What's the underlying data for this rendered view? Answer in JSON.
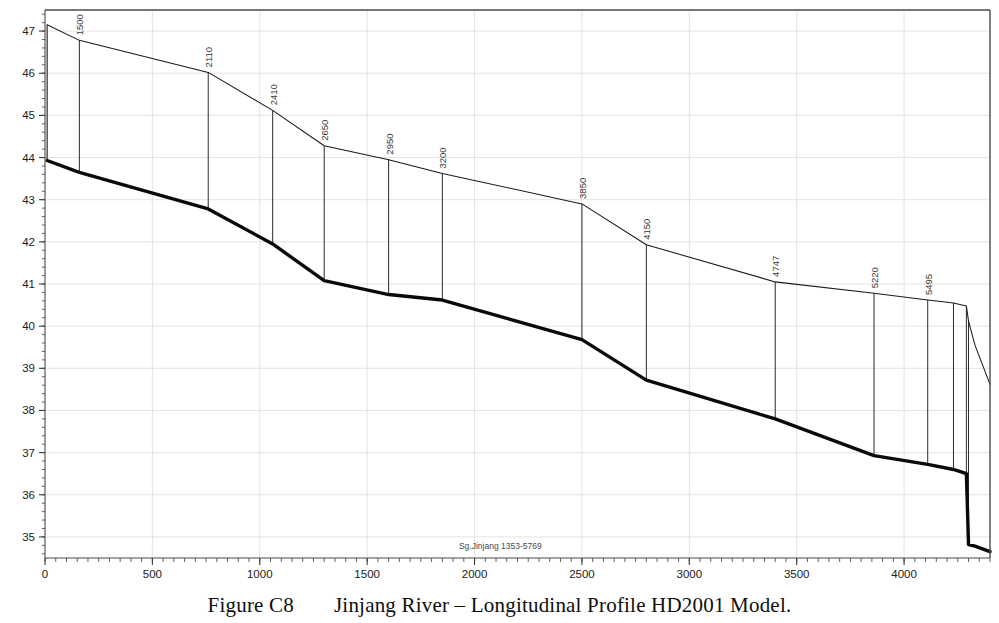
{
  "figure": {
    "caption_number": "Figure C8",
    "caption_text": "Jinjang River – Longitudinal Profile HD2001 Model.",
    "inline_annotation": "Sg.Jinjang 1353-5769"
  },
  "chart_data": {
    "type": "line",
    "title": "Jinjang River – Longitudinal Profile HD2001 Model.",
    "xlabel": "",
    "ylabel": "",
    "xlim": [
      0,
      4400
    ],
    "ylim": [
      34.5,
      47.5
    ],
    "grid": true,
    "legend_position": "none",
    "x_ticks": [
      0,
      500,
      1000,
      1500,
      2000,
      2500,
      3000,
      3500,
      4000
    ],
    "x_tick_labels": [
      "0",
      "500",
      "1000",
      "1500",
      "2000",
      "2500",
      "3000",
      "3500",
      "4000"
    ],
    "x_minor_step": 50,
    "y_ticks": [
      35,
      36,
      37,
      38,
      39,
      40,
      41,
      42,
      43,
      44,
      45,
      46,
      47
    ],
    "y_tick_labels": [
      "35",
      "36",
      "37",
      "38",
      "39",
      "40",
      "41",
      "42",
      "43",
      "44",
      "45",
      "46",
      "47"
    ],
    "y_minor_step": 0.2,
    "series": [
      {
        "name": "water-surface-profile",
        "style": "thin",
        "color": "#1a1a1a",
        "x": [
          10,
          160,
          760,
          1060,
          1300,
          1600,
          1850,
          2500,
          2800,
          3400,
          3860,
          4110,
          4230,
          4290,
          4300,
          4330,
          4400
        ],
        "y": [
          47.15,
          46.78,
          46.02,
          45.12,
          44.28,
          43.95,
          43.62,
          42.9,
          41.93,
          41.05,
          40.78,
          40.62,
          40.55,
          40.48,
          40.12,
          39.55,
          38.62
        ]
      },
      {
        "name": "river-bed-profile",
        "style": "thick",
        "color": "#0a0a0a",
        "x": [
          10,
          160,
          760,
          1060,
          1300,
          1600,
          1850,
          2500,
          2800,
          3400,
          3860,
          4110,
          4230,
          4290,
          4300,
          4330,
          4400
        ],
        "y": [
          43.93,
          43.65,
          42.78,
          41.95,
          41.08,
          40.75,
          40.62,
          39.68,
          38.72,
          37.8,
          36.93,
          36.72,
          36.6,
          36.5,
          34.82,
          34.78,
          34.65
        ]
      }
    ],
    "cross_sections": [
      {
        "label": "1500",
        "x": 160,
        "y_top": 46.78,
        "y_bottom": 43.65
      },
      {
        "label": "2110",
        "x": 760,
        "y_top": 46.02,
        "y_bottom": 42.78
      },
      {
        "label": "2410",
        "x": 1060,
        "y_top": 45.12,
        "y_bottom": 41.95
      },
      {
        "label": "2650",
        "x": 1300,
        "y_top": 44.28,
        "y_bottom": 41.08
      },
      {
        "label": "2950",
        "x": 1600,
        "y_top": 43.95,
        "y_bottom": 40.75
      },
      {
        "label": "3200",
        "x": 1850,
        "y_top": 43.62,
        "y_bottom": 40.62
      },
      {
        "label": "3850",
        "x": 2500,
        "y_top": 42.9,
        "y_bottom": 39.68
      },
      {
        "label": "4150",
        "x": 2800,
        "y_top": 41.93,
        "y_bottom": 38.72
      },
      {
        "label": "4747",
        "x": 3400,
        "y_top": 41.05,
        "y_bottom": 37.8
      },
      {
        "label": "5220",
        "x": 3860,
        "y_top": 40.78,
        "y_bottom": 36.93
      },
      {
        "label": "5495",
        "x": 4110,
        "y_top": 40.62,
        "y_bottom": 36.72
      },
      {
        "label": "",
        "x": 4230,
        "y_top": 40.55,
        "y_bottom": 36.6
      },
      {
        "label": "",
        "x": 4290,
        "y_top": 40.48,
        "y_bottom": 36.5
      },
      {
        "label": "",
        "x": 4300,
        "y_top": 40.12,
        "y_bottom": 34.82
      }
    ],
    "annotation": {
      "text": "Sg.Jinjang 1353-5769",
      "x": 2120,
      "y": 34.72
    }
  },
  "axis_colors": {
    "frame": "#4a4a4a",
    "gridline": "#dcdcdc",
    "tick": "#3a3a3a",
    "bed_line": "#0a0a0a",
    "water_line": "#1a1a1a"
  }
}
